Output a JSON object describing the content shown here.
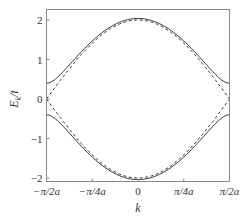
{
  "chart_data": {
    "type": "line",
    "title": "",
    "xlabel": "k",
    "ylabel": "E_k/t",
    "ylabel_main": "E",
    "ylabel_sub": "k",
    "ylabel_tail": "/t",
    "xlim": [
      -1.5708,
      1.5708
    ],
    "ylim": [
      -2.1,
      2.3
    ],
    "x_ticks": [
      {
        "value": -1.5708,
        "label": "−π/2a"
      },
      {
        "value": -0.7854,
        "label": "−π/4a"
      },
      {
        "value": 0,
        "label": "0"
      },
      {
        "value": 0.7854,
        "label": "π/4a"
      },
      {
        "value": 1.5708,
        "label": "π/2a"
      }
    ],
    "y_ticks": [
      {
        "value": 2,
        "label": "2"
      },
      {
        "value": 1,
        "label": "1"
      },
      {
        "value": 0,
        "label": "0"
      },
      {
        "value": -1,
        "label": "−1"
      },
      {
        "value": -2,
        "label": "−2"
      }
    ],
    "grid": false,
    "legend": null,
    "series": [
      {
        "name": "gapped upper band (solid)",
        "style": "solid",
        "formula": "+sqrt(4cos^2(ka)+0.4^2)",
        "x": [
          -1.5708,
          -1.1781,
          -0.7854,
          -0.3927,
          0,
          0.3927,
          0.7854,
          1.1781,
          1.5708
        ],
        "values": [
          0.4,
          0.86,
          1.47,
          1.86,
          2.0,
          1.86,
          1.47,
          0.86,
          0.4
        ]
      },
      {
        "name": "gapped lower band (solid)",
        "style": "solid",
        "formula": "-sqrt(4cos^2(ka)+0.4^2)",
        "x": [
          -1.5708,
          -1.1781,
          -0.7854,
          -0.3927,
          0,
          0.3927,
          0.7854,
          1.1781,
          1.5708
        ],
        "values": [
          -0.4,
          -0.86,
          -1.47,
          -1.86,
          -2.0,
          -1.86,
          -1.47,
          -0.86,
          -0.4
        ]
      },
      {
        "name": "gapless band + (dashed)",
        "style": "dashed",
        "formula": "2cos(ka)",
        "x": [
          -1.5708,
          -1.1781,
          -0.7854,
          -0.3927,
          0,
          0.3927,
          0.7854,
          1.1781,
          1.5708
        ],
        "values": [
          0,
          0.77,
          1.41,
          1.85,
          2.0,
          1.85,
          1.41,
          0.77,
          0
        ]
      },
      {
        "name": "gapless band − (dashed, reversed)",
        "style": "dashed",
        "formula": "-2cos(ka)",
        "x": [
          -1.5708,
          -1.1781,
          -0.7854,
          -0.3927,
          0,
          0.3927,
          0.7854,
          1.1781,
          1.5708
        ],
        "values": [
          0,
          -0.77,
          -1.41,
          -1.85,
          -2.0,
          -1.85,
          -1.41,
          -0.77,
          0
        ]
      }
    ],
    "gap": 0.4
  }
}
